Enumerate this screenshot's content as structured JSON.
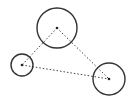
{
  "diagram": {
    "type": "circles-triangle",
    "stroke_color": "#333333",
    "dot_color": "#333333",
    "nodes": [
      {
        "id": "top",
        "cx": 57,
        "cy": 28,
        "r": 20
      },
      {
        "id": "left",
        "cx": 22,
        "cy": 65,
        "r": 11
      },
      {
        "id": "right",
        "cx": 109,
        "cy": 79,
        "r": 16
      }
    ],
    "edges": [
      {
        "from": "top",
        "to": "left",
        "style": "dotted"
      },
      {
        "from": "top",
        "to": "right",
        "style": "dotted"
      },
      {
        "from": "left",
        "to": "right",
        "style": "dotted"
      }
    ]
  }
}
